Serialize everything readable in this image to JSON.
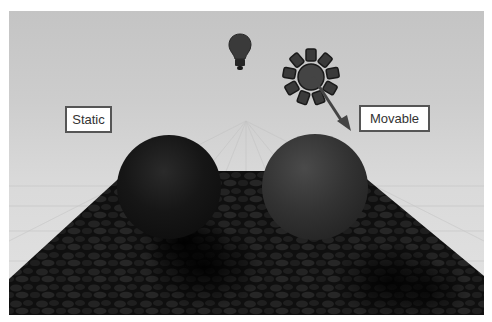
{
  "scene": {
    "labels": {
      "static": "Static",
      "movable": "Movable"
    },
    "icons": {
      "point_light": "lightbulb-icon",
      "directional_light": "sun-icon",
      "direction_arrow": "arrow-icon"
    },
    "objects": {
      "left_sphere": "static-sphere",
      "right_sphere": "movable-sphere",
      "floor": "cobblestone-floor"
    },
    "colors": {
      "background": "#cdcdcd",
      "floor": "#1e1e1e",
      "label_border": "#555555",
      "label_text": "#333333",
      "icon_fill": "#3a3a3a"
    }
  }
}
